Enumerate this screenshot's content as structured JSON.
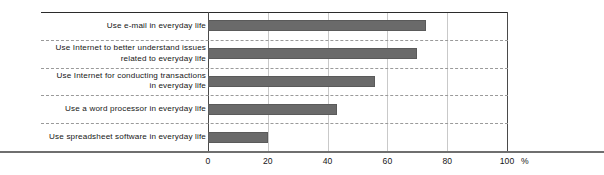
{
  "chart_data": {
    "type": "bar",
    "orientation": "horizontal",
    "title": "",
    "subtitle": "",
    "xlabel": "%",
    "ylabel": "",
    "categories": [
      "Use e-mail in everyday life",
      "Use Internet to better understand issues\nrelated to everyday life",
      "Use Internet for conducting transactions\nin everyday life",
      "Use a word processor in everyday life",
      "Use spreadsheet software in everyday life"
    ],
    "values": [
      73,
      70,
      56,
      43,
      20
    ],
    "xlim": [
      0,
      100
    ],
    "xticks": [
      0,
      20,
      40,
      60,
      80,
      100
    ],
    "xtick_labels": [
      "0",
      "20",
      "40",
      "60",
      "80",
      "100"
    ],
    "unit_label": "%",
    "grid": "vertical-only",
    "legend": "none",
    "bar_color": "#6a6a6a",
    "gridline_color": "#c9c9c9",
    "separator_color": "#9a9a9a",
    "axis_color": "#4a4a4a",
    "baseline_color": "#6f6f6f",
    "text_color": "#161616"
  }
}
